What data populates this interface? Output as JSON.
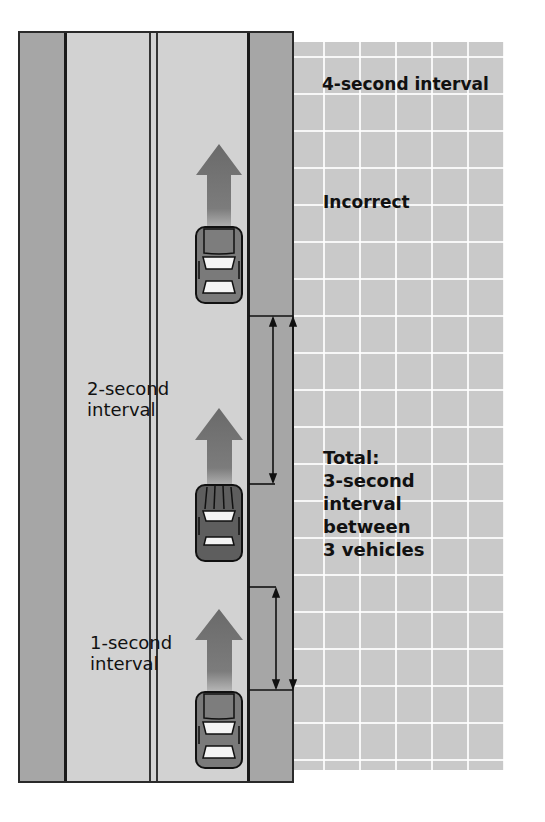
{
  "diagram": {
    "colors": {
      "road": "#d2d2d2",
      "shoulder": "#a6a6a6",
      "grid_background": "#c9c9c9",
      "grid_lines": "#ffffff",
      "arrow": "#6e6e6e",
      "car_body": "#7a7a7a",
      "car_dark": "#5a5a5a",
      "line": "#1a1a1a"
    },
    "labels": {
      "four_second": "4-second interval",
      "incorrect": "Incorrect",
      "two_second": "2-second\ninterval",
      "one_second": "1-second\ninterval",
      "total": "Total:\n3-second\ninterval\nbetween\n3 vehicles"
    },
    "vehicles": [
      {
        "name": "lead-car",
        "position": "top",
        "type": "sedan"
      },
      {
        "name": "middle-car",
        "position": "middle",
        "type": "sedan-dark"
      },
      {
        "name": "rear-car",
        "position": "bottom",
        "type": "sedan"
      }
    ],
    "brackets": [
      {
        "name": "two-second-bracket",
        "from": "lead-car",
        "to": "middle-car"
      },
      {
        "name": "one-second-bracket",
        "from": "middle-car",
        "to": "rear-car"
      },
      {
        "name": "total-bracket",
        "from": "lead-car",
        "to": "rear-car"
      }
    ]
  }
}
